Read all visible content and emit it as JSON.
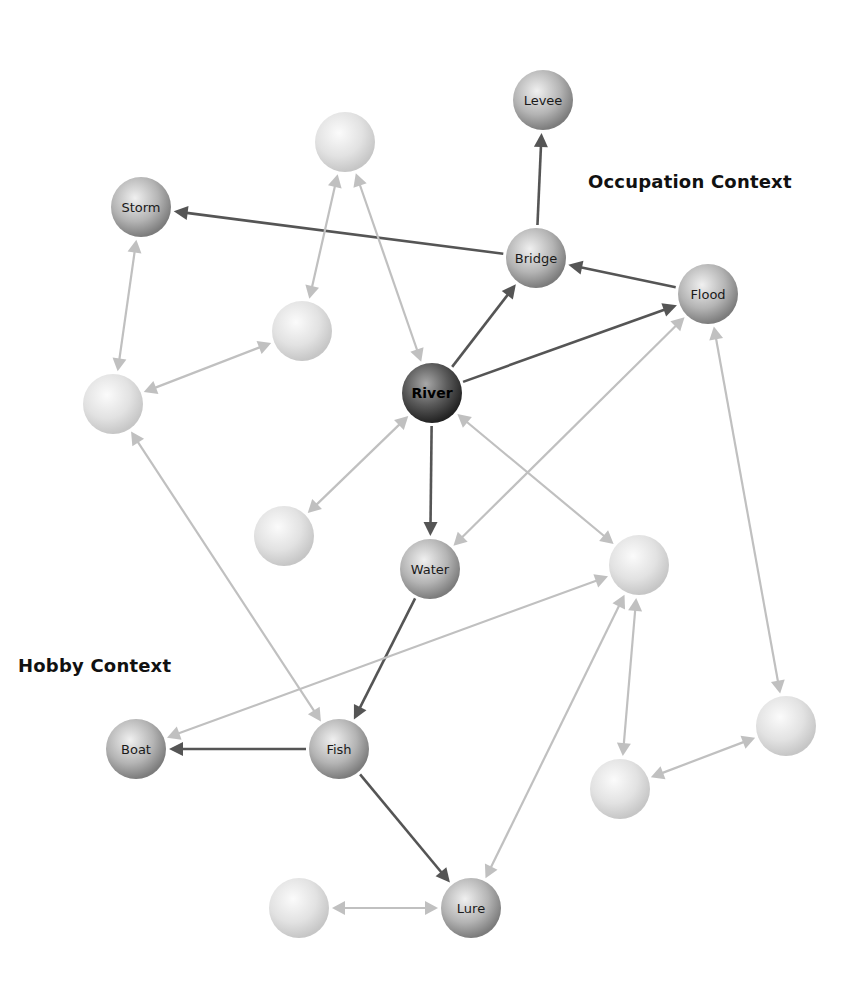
{
  "contexts": [
    {
      "id": "occupation",
      "label": "Occupation Context",
      "x": 588,
      "y": 171
    },
    {
      "id": "hobby",
      "label": "Hobby Context",
      "x": 18,
      "y": 655
    }
  ],
  "colors": {
    "strong_edge": "#555555",
    "weak_edge": "#c0c0c0",
    "node_dark_center": "#9a9a9a",
    "node_dark_edge": "#2a2a2a",
    "node_mid_center": "#e6e6e6",
    "node_mid_edge": "#7a7a7a",
    "node_light_center": "#f8f8f8",
    "node_light_edge": "#c4c4c4"
  },
  "nodes": [
    {
      "id": "levee",
      "label": "Levee",
      "x": 543,
      "y": 100,
      "style": "mid"
    },
    {
      "id": "b1",
      "label": "",
      "x": 345,
      "y": 142,
      "style": "light"
    },
    {
      "id": "storm",
      "label": "Storm",
      "x": 141,
      "y": 207,
      "style": "mid"
    },
    {
      "id": "bridge",
      "label": "Bridge",
      "x": 536,
      "y": 258,
      "style": "mid"
    },
    {
      "id": "flood",
      "label": "Flood",
      "x": 708,
      "y": 294,
      "style": "mid"
    },
    {
      "id": "b2",
      "label": "",
      "x": 302,
      "y": 331,
      "style": "light"
    },
    {
      "id": "b3",
      "label": "",
      "x": 113,
      "y": 404,
      "style": "light"
    },
    {
      "id": "river",
      "label": "River",
      "x": 432,
      "y": 393,
      "style": "dark"
    },
    {
      "id": "b4",
      "label": "",
      "x": 284,
      "y": 536,
      "style": "light"
    },
    {
      "id": "water",
      "label": "Water",
      "x": 430,
      "y": 569,
      "style": "mid"
    },
    {
      "id": "b5",
      "label": "",
      "x": 639,
      "y": 565,
      "style": "light"
    },
    {
      "id": "boat",
      "label": "Boat",
      "x": 136,
      "y": 749,
      "style": "mid"
    },
    {
      "id": "fish",
      "label": "Fish",
      "x": 339,
      "y": 749,
      "style": "mid"
    },
    {
      "id": "b6",
      "label": "",
      "x": 786,
      "y": 726,
      "style": "light"
    },
    {
      "id": "b7",
      "label": "",
      "x": 620,
      "y": 789,
      "style": "light"
    },
    {
      "id": "b8",
      "label": "",
      "x": 299,
      "y": 908,
      "style": "light"
    },
    {
      "id": "lure",
      "label": "Lure",
      "x": 471,
      "y": 908,
      "style": "mid"
    }
  ],
  "edges": [
    {
      "from": "river",
      "to": "bridge",
      "kind": "strong",
      "arrow_start": false,
      "arrow_end": true
    },
    {
      "from": "river",
      "to": "flood",
      "kind": "strong",
      "arrow_start": false,
      "arrow_end": true
    },
    {
      "from": "river",
      "to": "water",
      "kind": "strong",
      "arrow_start": false,
      "arrow_end": true
    },
    {
      "from": "bridge",
      "to": "levee",
      "kind": "strong",
      "arrow_start": false,
      "arrow_end": true
    },
    {
      "from": "bridge",
      "to": "storm",
      "kind": "strong",
      "arrow_start": false,
      "arrow_end": true
    },
    {
      "from": "flood",
      "to": "bridge",
      "kind": "strong",
      "arrow_start": false,
      "arrow_end": true
    },
    {
      "from": "water",
      "to": "fish",
      "kind": "strong",
      "arrow_start": false,
      "arrow_end": true
    },
    {
      "from": "fish",
      "to": "boat",
      "kind": "strong",
      "arrow_start": false,
      "arrow_end": true
    },
    {
      "from": "fish",
      "to": "lure",
      "kind": "strong",
      "arrow_start": false,
      "arrow_end": true
    },
    {
      "from": "b1",
      "to": "b2",
      "kind": "weak",
      "arrow_start": true,
      "arrow_end": true
    },
    {
      "from": "b1",
      "to": "river",
      "kind": "weak",
      "arrow_start": true,
      "arrow_end": true
    },
    {
      "from": "storm",
      "to": "b3",
      "kind": "weak",
      "arrow_start": true,
      "arrow_end": true
    },
    {
      "from": "b3",
      "to": "b2",
      "kind": "weak",
      "arrow_start": true,
      "arrow_end": true
    },
    {
      "from": "b3",
      "to": "fish",
      "kind": "weak",
      "arrow_start": true,
      "arrow_end": true
    },
    {
      "from": "river",
      "to": "b4",
      "kind": "weak",
      "arrow_start": true,
      "arrow_end": true
    },
    {
      "from": "flood",
      "to": "water",
      "kind": "weak",
      "arrow_start": true,
      "arrow_end": true
    },
    {
      "from": "river",
      "to": "b5",
      "kind": "weak",
      "arrow_start": true,
      "arrow_end": true
    },
    {
      "from": "b5",
      "to": "boat",
      "kind": "weak",
      "arrow_start": true,
      "arrow_end": true
    },
    {
      "from": "b5",
      "to": "lure",
      "kind": "weak",
      "arrow_start": true,
      "arrow_end": true
    },
    {
      "from": "b5",
      "to": "b7",
      "kind": "weak",
      "arrow_start": true,
      "arrow_end": true
    },
    {
      "from": "flood",
      "to": "b6",
      "kind": "weak",
      "arrow_start": true,
      "arrow_end": true
    },
    {
      "from": "b6",
      "to": "b7",
      "kind": "weak",
      "arrow_start": true,
      "arrow_end": true
    },
    {
      "from": "b8",
      "to": "lure",
      "kind": "weak",
      "arrow_start": true,
      "arrow_end": true
    }
  ]
}
